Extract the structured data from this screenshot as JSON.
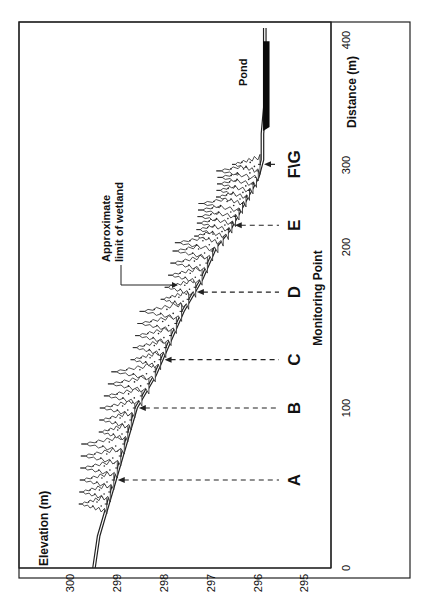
{
  "figure": {
    "orientation": "rotated-90-ccw",
    "y_axis_title": "Elevation (m)",
    "x_axis_title": "Distance (m)",
    "center_label": "Monitoring Point",
    "y_ticks": [
      "300",
      "299",
      "298",
      "297",
      "296",
      "295"
    ],
    "x_ticks": [
      "0",
      "100",
      "200",
      "300",
      "400"
    ],
    "monitoring_points": [
      {
        "label": "A",
        "distance": 55
      },
      {
        "label": "B",
        "distance": 100
      },
      {
        "label": "C",
        "distance": 130
      },
      {
        "label": "D",
        "distance": 172
      },
      {
        "label": "E",
        "distance": 225
      },
      {
        "label": "F\\G",
        "distance": 295
      }
    ],
    "annotation": {
      "line1": "Approximate",
      "line2": "limit of wetland"
    },
    "pond_label": "Pond",
    "colors": {
      "ink": "#111111",
      "background": "#ffffff",
      "pond": "#0a0a0a"
    }
  },
  "chart_data": {
    "type": "line",
    "title": "",
    "xlabel": "Distance (m)",
    "ylabel": "Elevation (m)",
    "xlim": [
      0,
      400
    ],
    "ylim": [
      295,
      300
    ],
    "x_ticks": [
      0,
      100,
      200,
      300,
      400
    ],
    "y_ticks": [
      295,
      296,
      297,
      298,
      299,
      300
    ],
    "series": [
      {
        "name": "Ground surface profile",
        "x": [
          0,
          20,
          40,
          60,
          80,
          100,
          120,
          140,
          160,
          180,
          200,
          220,
          240,
          260,
          280,
          300,
          320,
          340,
          360,
          380,
          400
        ],
        "y": [
          299.6,
          299.5,
          299.3,
          299.1,
          298.9,
          298.7,
          298.3,
          298.0,
          297.7,
          297.3,
          297.0,
          296.7,
          296.5,
          296.3,
          296.1,
          296.0,
          296.0,
          295.95,
          295.95,
          295.95,
          295.95
        ]
      }
    ],
    "monitoring_points": {
      "A": 55,
      "B": 100,
      "C": 130,
      "D": 172,
      "E": 225,
      "F\\G": 295
    },
    "annotations": [
      "Approximate limit of wetland (≈ 225 m)",
      "Pond (≈ 325–390 m)",
      "Trees (forested wetland) from ≈ 40 m to ≈ 300 m"
    ],
    "grid": false
  }
}
